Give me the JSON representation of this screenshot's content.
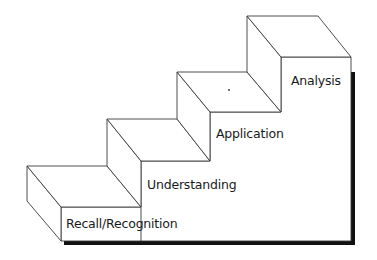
{
  "diagram": {
    "type": "staircase",
    "colors": {
      "stroke": "#3a3a3a",
      "fill": "#ffffff",
      "shadow": "#111111",
      "text": "#1a1a1a"
    },
    "steps": [
      {
        "level": 1,
        "label": "Recall/Recognition"
      },
      {
        "level": 2,
        "label": "Understanding"
      },
      {
        "level": 3,
        "label": "Application"
      },
      {
        "level": 4,
        "label": "Analysis"
      }
    ],
    "marker": "•"
  }
}
